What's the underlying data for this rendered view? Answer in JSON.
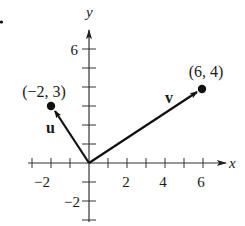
{
  "figure": {
    "problem_marker": ".",
    "axes": {
      "x_label": "x",
      "y_label": "y",
      "x_tick_labels": [
        {
          "value": -2,
          "text": "−2"
        },
        {
          "value": 2,
          "text": "2"
        },
        {
          "value": 4,
          "text": "4"
        },
        {
          "value": 6,
          "text": "6"
        }
      ],
      "y_tick_labels": [
        {
          "value": 6,
          "text": "6"
        },
        {
          "value": -2,
          "text": "−2"
        }
      ],
      "x_range": [
        -3,
        7
      ],
      "y_range": [
        -3,
        7
      ]
    },
    "vectors": [
      {
        "name": "u",
        "label": "u",
        "from": [
          0,
          0
        ],
        "to": [
          -2,
          3
        ],
        "point_label": "(−2, 3)"
      },
      {
        "name": "v",
        "label": "v",
        "from": [
          0,
          0
        ],
        "to": [
          6,
          4
        ],
        "point_label": "(6, 4)"
      }
    ]
  }
}
